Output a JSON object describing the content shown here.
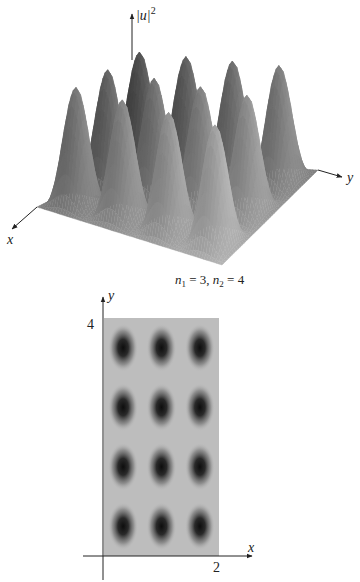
{
  "chart_data": [
    {
      "type": "surface3d",
      "title": "",
      "function": "|u|^2 = sin^2(n1*pi*x/a) * sin^2(n2*pi*y/b)",
      "params": {
        "n1": 3,
        "n2": 4,
        "a": 2,
        "b": 4
      },
      "axes": {
        "x": "x",
        "y": "y",
        "z": "|u|^2"
      },
      "x_range": [
        0,
        2
      ],
      "y_range": [
        0,
        4
      ],
      "peaks": {
        "count": 12,
        "grid": [
          3,
          4
        ]
      },
      "annotation": "n₁ = 3, n₂ = 4"
    },
    {
      "type": "heatmap",
      "title": "",
      "xlabel": "x",
      "ylabel": "y",
      "xlim": [
        0,
        2
      ],
      "ylim": [
        0,
        4
      ],
      "x_ticks": [
        "2"
      ],
      "y_ticks": [
        "4"
      ],
      "blob_grid": {
        "columns": 3,
        "rows": 4
      },
      "blob_centers_x": [
        0.333,
        1.0,
        1.667
      ],
      "blob_centers_y": [
        0.5,
        1.5,
        2.5,
        3.5
      ],
      "colormap": "gray (dark = high |u|^2)"
    }
  ],
  "surface": {
    "z_label_base": "|u|",
    "z_label_exp": "2",
    "x_label": "x",
    "y_label": "y",
    "caption_n1_sym": "n",
    "caption_n1_sub": "1",
    "caption_n1_val": " = 3, ",
    "caption_n2_sym": "n",
    "caption_n2_sub": "2",
    "caption_n2_val": " = 4"
  },
  "density": {
    "x_label": "x",
    "y_label": "y",
    "x_tick": "2",
    "y_tick": "4",
    "background_color": "#bdbdbd",
    "blob_color": "#111111"
  }
}
